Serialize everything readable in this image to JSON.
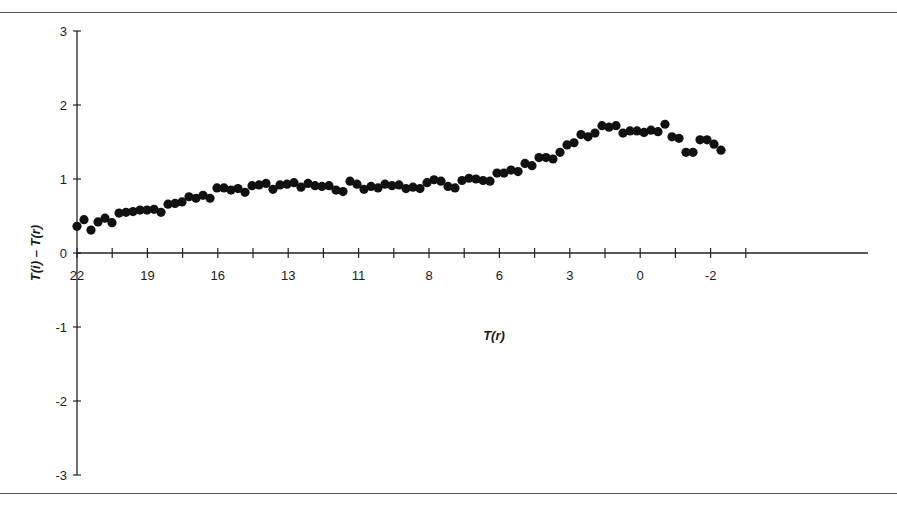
{
  "chart_data": {
    "type": "scatter",
    "title": "",
    "xlabel": "T(r)",
    "ylabel": "T(i) – T(r)",
    "x_tick_labels": [
      "22",
      "19",
      "16",
      "13",
      "11",
      "8",
      "6",
      "3",
      "0",
      "-2"
    ],
    "y_tick_labels": [
      "3",
      "2",
      "1",
      "0",
      "-1",
      "-2",
      "-3"
    ],
    "y_ticks": [
      3,
      2,
      1,
      0,
      -1,
      -2,
      -3
    ],
    "ylim": [
      -3,
      3
    ],
    "grid": false,
    "legend": null,
    "marker": "filled-circle",
    "point_color": "#111111",
    "note": "x axis reversed (warm to cold); points evenly spaced along the axis",
    "points_x_index_step": 0.5,
    "values": [
      0.36,
      0.45,
      0.31,
      0.42,
      0.47,
      0.41,
      0.54,
      0.55,
      0.56,
      0.58,
      0.58,
      0.59,
      0.55,
      0.66,
      0.67,
      0.69,
      0.76,
      0.74,
      0.78,
      0.74,
      0.88,
      0.88,
      0.85,
      0.87,
      0.82,
      0.91,
      0.92,
      0.94,
      0.86,
      0.92,
      0.93,
      0.95,
      0.89,
      0.94,
      0.91,
      0.9,
      0.91,
      0.85,
      0.83,
      0.97,
      0.93,
      0.86,
      0.9,
      0.88,
      0.93,
      0.91,
      0.92,
      0.87,
      0.89,
      0.87,
      0.95,
      0.99,
      0.97,
      0.9,
      0.88,
      0.98,
      1.01,
      1.0,
      0.98,
      0.97,
      1.08,
      1.08,
      1.12,
      1.1,
      1.21,
      1.18,
      1.29,
      1.29,
      1.27,
      1.36,
      1.46,
      1.49,
      1.6,
      1.57,
      1.62,
      1.72,
      1.7,
      1.72,
      1.62,
      1.65,
      1.65,
      1.63,
      1.66,
      1.64,
      1.74,
      1.57,
      1.55,
      1.36,
      1.36,
      1.53,
      1.53,
      1.47,
      1.39
    ]
  },
  "layout": {
    "plot_left": 77,
    "plot_right": 868,
    "y_zero": 253,
    "px_per_unit": 74,
    "x_tick_spacing": 35.2,
    "first_point_x": 77,
    "point_spacing": 7.0
  }
}
